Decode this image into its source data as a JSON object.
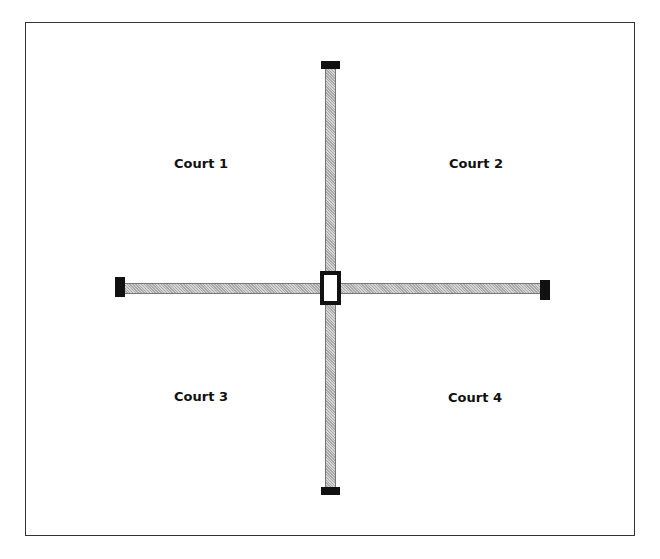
{
  "diagram": {
    "type": "court-layout",
    "courts": [
      {
        "label": "Court 1",
        "position": "top-left"
      },
      {
        "label": "Court 2",
        "position": "top-right"
      },
      {
        "label": "Court 3",
        "position": "bottom-left"
      },
      {
        "label": "Court 4",
        "position": "bottom-right"
      }
    ],
    "dividers": {
      "vertical": "center-divider-vertical",
      "horizontal": "center-divider-horizontal",
      "hub": "center-post"
    },
    "colors": {
      "frame": "#333333",
      "divider_fill": "#bfbfbf",
      "cap": "#111111",
      "text": "#111111"
    }
  }
}
